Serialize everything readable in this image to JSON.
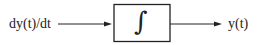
{
  "diagram": {
    "type": "block-diagram",
    "input_label": "dy(t)/dt",
    "block_symbol": "∫",
    "block_name": "integrator",
    "output_label": "y(t)",
    "colors": {
      "stroke": "#222222",
      "background": "#ffffff"
    }
  }
}
